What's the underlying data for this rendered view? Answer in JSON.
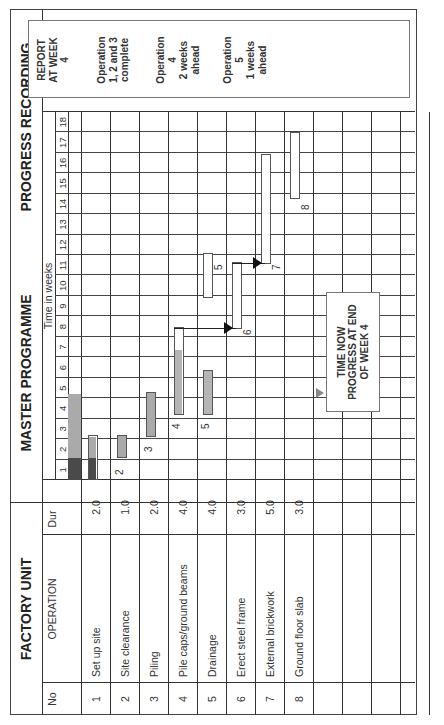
{
  "titles": {
    "left": "FACTORY UNIT",
    "middle": "MASTER PROGRAMME",
    "right": "PROGRESS RECORDING"
  },
  "headers": {
    "no": "No",
    "operation": "OPERATION",
    "dur": "Dur",
    "time": "Time in weeks"
  },
  "weeks": [
    "1",
    "2",
    "3",
    "4",
    "5",
    "6",
    "7",
    "8",
    "9",
    "10",
    "11",
    "12",
    "13",
    "14",
    "15",
    "16",
    "17",
    "18"
  ],
  "operations": [
    {
      "no": "1",
      "name": "Set up site",
      "dur": "2.0"
    },
    {
      "no": "2",
      "name": "Site clearance",
      "dur": "1.0"
    },
    {
      "no": "3",
      "name": "Piling",
      "dur": "2.0"
    },
    {
      "no": "4",
      "name": "Pile caps/ground beams",
      "dur": "4.0"
    },
    {
      "no": "5",
      "name": "Drainage",
      "dur": "4.0"
    },
    {
      "no": "6",
      "name": "Erect steel frame",
      "dur": "3.0"
    },
    {
      "no": "7",
      "name": "External brickwork",
      "dur": "5.0"
    },
    {
      "no": "8",
      "name": "Ground floor slab",
      "dur": "3.0"
    }
  ],
  "bar_labels": [
    "2",
    "3",
    "4",
    "5",
    "6",
    "7",
    "8"
  ],
  "time_now": {
    "line1": "TIME NOW",
    "line2": "PROGRESS AT END",
    "line3": "OF WEEK 4"
  },
  "report": {
    "heading1": "REPORT",
    "heading2": "AT WEEK",
    "heading3": "4",
    "notes": [
      {
        "l1": "Operation",
        "l2": "1, 2 and 3",
        "l3": "complete"
      },
      {
        "l1": "Operation",
        "l2": "4",
        "l3": "2 weeks",
        "l4": "ahead"
      },
      {
        "l1": "Operation",
        "l2": "5",
        "l3": "1 weeks",
        "l4": "ahead"
      }
    ]
  },
  "colors": {
    "planned_bar": "#ffffff",
    "progress_dark": "#555555",
    "progress_light": "#b0b0b0",
    "grid": "#333333"
  },
  "chart_data": {
    "type": "gantt",
    "xlabel": "Time in weeks",
    "x_range": [
      1,
      18
    ],
    "time_now_week": 4,
    "tasks": [
      {
        "no": 1,
        "name": "Set up site",
        "duration": 2.0,
        "planned_start": 1,
        "planned_end": 2,
        "progress_to_week": 2,
        "status": "complete"
      },
      {
        "no": 2,
        "name": "Site clearance",
        "duration": 1.0,
        "planned_start": 2,
        "planned_end": 2,
        "progress_to_week": 2,
        "status": "complete"
      },
      {
        "no": 3,
        "name": "Piling",
        "duration": 2.0,
        "planned_start": 3,
        "planned_end": 4,
        "progress_to_week": 4,
        "status": "complete"
      },
      {
        "no": 4,
        "name": "Pile caps/ground beams",
        "duration": 4.0,
        "planned_start": 4,
        "planned_end": 7,
        "progress_to_week": 6,
        "status": "2 weeks ahead"
      },
      {
        "no": 5,
        "name": "Drainage",
        "duration": 4.0,
        "planned_start": 4,
        "planned_end": 5,
        "progress_to_week": 5,
        "status": "1 weeks ahead"
      },
      {
        "no": 6,
        "name": "Erect steel frame",
        "duration": 3.0,
        "planned_start": 8,
        "planned_end": 10,
        "status": "not started"
      },
      {
        "no": 7,
        "name": "External brickwork",
        "duration": 5.0,
        "planned_start": 11,
        "planned_end": 15,
        "status": "not started"
      },
      {
        "no": 8,
        "name": "Ground floor slab",
        "duration": 3.0,
        "planned_start": 14,
        "planned_end": 16,
        "status": "not started"
      }
    ],
    "dependencies": [
      {
        "from": 4,
        "to": 6
      },
      {
        "from": 6,
        "to": 7
      }
    ],
    "annotations": [
      "TIME NOW PROGRESS AT END OF WEEK 4",
      "REPORT AT WEEK 4"
    ]
  }
}
